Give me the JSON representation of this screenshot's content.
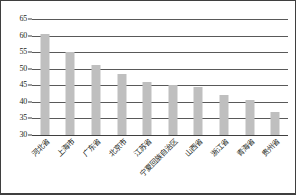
{
  "chart_data": {
    "type": "bar",
    "title": "",
    "xlabel": "",
    "ylabel": "",
    "ylim": [
      30,
      65
    ],
    "ytick_step": 5,
    "yticks": [
      30,
      35,
      40,
      45,
      50,
      55,
      60,
      65
    ],
    "grid": true,
    "legend": null,
    "bar_color": "#bfbfbf",
    "categories": [
      "河北省",
      "上海市",
      "广东省",
      "北京市",
      "江苏省",
      "宁夏回族自治区",
      "山西省",
      "浙江省",
      "青海省",
      "贵州省"
    ],
    "values": [
      60.5,
      55.0,
      51.2,
      48.5,
      46.0,
      45.0,
      44.5,
      42.2,
      40.5,
      36.8
    ]
  },
  "colors": {
    "bar": "#bfbfbf",
    "gridline": "#595959",
    "axis": "#3f3f3f",
    "text": "#231f20",
    "background": "#ffffff"
  }
}
